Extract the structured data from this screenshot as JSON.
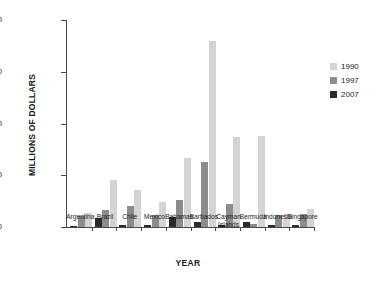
{
  "chart_data": {
    "type": "bar",
    "title": "",
    "xlabel": "YEAR",
    "ylabel": "MILLIONS OF DOLLARS",
    "ylim": [
      0,
      40000
    ],
    "ytick_labels": [
      "40000",
      "30000",
      "20000",
      "10000",
      "0"
    ],
    "ytick_values": [
      40000,
      30000,
      20000,
      10000,
      0
    ],
    "grid": false,
    "legend_position": "right",
    "categories": [
      "Argentina",
      "Brazil",
      "Chile",
      "Mexico",
      "Bahamas",
      "Barbados",
      "Cayman\nIslands",
      "Bermuda",
      "Indonesia",
      "Singapore"
    ],
    "series": [
      {
        "name": "2007",
        "color": "#2b2b2b",
        "values": [
          200,
          1700,
          400,
          300,
          1900,
          900,
          400,
          900,
          300,
          400
        ]
      },
      {
        "name": "1997",
        "color": "#8c8c8c",
        "values": [
          2200,
          3200,
          4000,
          2300,
          5300,
          12500,
          4400,
          500,
          2300,
          2500
        ]
      },
      {
        "name": "1990",
        "color": "#d4d4d4",
        "values": [
          2700,
          9000,
          7100,
          4800,
          13300,
          36000,
          17400,
          17600,
          2600,
          3400
        ]
      }
    ]
  },
  "legend": {
    "items": [
      {
        "label": "1990",
        "color": "#d4d4d4"
      },
      {
        "label": "1997",
        "color": "#8c8c8c"
      },
      {
        "label": "2007",
        "color": "#2b2b2b"
      }
    ]
  }
}
